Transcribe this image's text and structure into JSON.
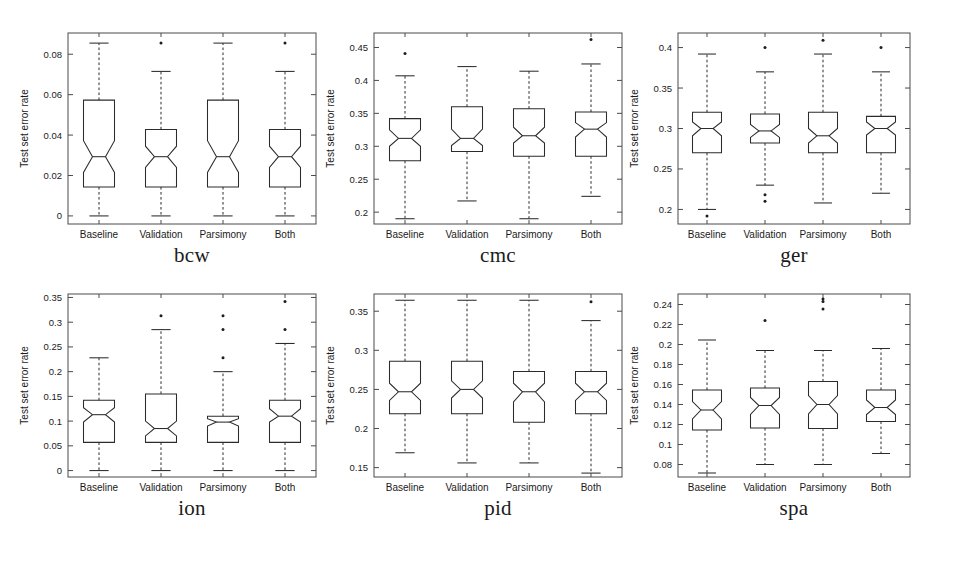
{
  "figure": {
    "title": "",
    "background": "#ffffff",
    "ink_color": "#2b2b2b",
    "rows": 2,
    "cols": 3
  },
  "common": {
    "ylabel": "Test set error rate",
    "groups": [
      "Baseline",
      "Validation",
      "Parsimony",
      "Both"
    ]
  },
  "chart_data": [
    {
      "type": "box",
      "panel_id": "bcw",
      "title": "bcw",
      "xlabel": "",
      "ylabel": "Test set error rate",
      "categories": [
        "Baseline",
        "Validation",
        "Parsimony",
        "Both"
      ],
      "yticks": [
        0,
        0.02,
        0.04,
        0.06,
        0.08
      ],
      "ytick_labels": [
        "0",
        "0.02",
        "0.04",
        "0.06",
        "0.08"
      ],
      "ylim": [
        -0.004,
        0.0905
      ],
      "grid": false,
      "legend": "none",
      "boxes": [
        {
          "label": "Baseline",
          "whisker_low": 0.0,
          "q1": 0.0143,
          "median": 0.0293,
          "q3": 0.0573,
          "whisker_high": 0.0855,
          "notch_low": 0.0215,
          "notch_high": 0.0372,
          "outliers": []
        },
        {
          "label": "Validation",
          "whisker_low": 0.0,
          "q1": 0.0143,
          "median": 0.0293,
          "q3": 0.0428,
          "whisker_high": 0.0715,
          "notch_low": 0.024,
          "notch_high": 0.0345,
          "outliers": [
            0.0855
          ]
        },
        {
          "label": "Parsimony",
          "whisker_low": 0.0,
          "q1": 0.0143,
          "median": 0.0293,
          "q3": 0.0573,
          "whisker_high": 0.0855,
          "notch_low": 0.0215,
          "notch_high": 0.0372,
          "outliers": []
        },
        {
          "label": "Both",
          "whisker_low": 0.0,
          "q1": 0.0143,
          "median": 0.0293,
          "q3": 0.0428,
          "whisker_high": 0.0715,
          "notch_low": 0.024,
          "notch_high": 0.0345,
          "outliers": [
            0.0855
          ]
        }
      ]
    },
    {
      "type": "box",
      "panel_id": "cmc",
      "title": "cmc",
      "xlabel": "",
      "ylabel": "Test set error rate",
      "categories": [
        "Baseline",
        "Validation",
        "Parsimony",
        "Both"
      ],
      "yticks": [
        0.2,
        0.25,
        0.3,
        0.35,
        0.4,
        0.45
      ],
      "ytick_labels": [
        "0.2",
        "0.25",
        "0.3",
        "0.35",
        "0.4",
        "0.45"
      ],
      "ylim": [
        0.182,
        0.472
      ],
      "grid": false,
      "legend": "none",
      "boxes": [
        {
          "label": "Baseline",
          "whisker_low": 0.19,
          "q1": 0.278,
          "median": 0.312,
          "q3": 0.342,
          "whisker_high": 0.407,
          "notch_low": 0.3,
          "notch_high": 0.325,
          "outliers": [
            0.441
          ]
        },
        {
          "label": "Validation",
          "whisker_low": 0.217,
          "q1": 0.292,
          "median": 0.312,
          "q3": 0.36,
          "whisker_high": 0.421,
          "notch_low": 0.301,
          "notch_high": 0.326,
          "outliers": []
        },
        {
          "label": "Parsimony",
          "whisker_low": 0.19,
          "q1": 0.285,
          "median": 0.316,
          "q3": 0.357,
          "whisker_high": 0.414,
          "notch_low": 0.305,
          "notch_high": 0.329,
          "outliers": []
        },
        {
          "label": "Both",
          "whisker_low": 0.224,
          "q1": 0.285,
          "median": 0.326,
          "q3": 0.352,
          "whisker_high": 0.425,
          "notch_low": 0.314,
          "notch_high": 0.336,
          "outliers": [
            0.462
          ]
        }
      ]
    },
    {
      "type": "box",
      "panel_id": "ger",
      "title": "ger",
      "xlabel": "",
      "ylabel": "Test set error rate",
      "categories": [
        "Baseline",
        "Validation",
        "Parsimony",
        "Both"
      ],
      "yticks": [
        0.2,
        0.25,
        0.3,
        0.35,
        0.4
      ],
      "ytick_labels": [
        "0.2",
        "0.25",
        "0.3",
        "0.35",
        "0.4"
      ],
      "ylim": [
        0.182,
        0.418
      ],
      "grid": false,
      "legend": "none",
      "boxes": [
        {
          "label": "Baseline",
          "whisker_low": 0.2,
          "q1": 0.27,
          "median": 0.3,
          "q3": 0.32,
          "whisker_high": 0.392,
          "notch_low": 0.291,
          "notch_high": 0.308,
          "outliers": [
            0.192
          ]
        },
        {
          "label": "Validation",
          "whisker_low": 0.23,
          "q1": 0.282,
          "median": 0.297,
          "q3": 0.318,
          "whisker_high": 0.37,
          "notch_low": 0.289,
          "notch_high": 0.305,
          "outliers": [
            0.4,
            0.218,
            0.21
          ]
        },
        {
          "label": "Parsimony",
          "whisker_low": 0.208,
          "q1": 0.27,
          "median": 0.291,
          "q3": 0.32,
          "whisker_high": 0.392,
          "notch_low": 0.282,
          "notch_high": 0.3,
          "outliers": [
            0.409
          ]
        },
        {
          "label": "Both",
          "whisker_low": 0.22,
          "q1": 0.27,
          "median": 0.3,
          "q3": 0.315,
          "whisker_high": 0.37,
          "notch_low": 0.292,
          "notch_high": 0.308,
          "outliers": [
            0.4
          ]
        }
      ]
    },
    {
      "type": "box",
      "panel_id": "ion",
      "title": "ion",
      "xlabel": "",
      "ylabel": "Test set error rate",
      "categories": [
        "Baseline",
        "Validation",
        "Parsimony",
        "Both"
      ],
      "yticks": [
        0,
        0.05,
        0.1,
        0.15,
        0.2,
        0.25,
        0.3,
        0.35
      ],
      "ytick_labels": [
        "0",
        "0.05",
        "0.1",
        "0.15",
        "0.2",
        "0.25",
        "0.3",
        "0.35"
      ],
      "ylim": [
        -0.013,
        0.357
      ],
      "grid": false,
      "legend": "none",
      "boxes": [
        {
          "label": "Baseline",
          "whisker_low": 0.0,
          "q1": 0.057,
          "median": 0.113,
          "q3": 0.142,
          "whisker_high": 0.228,
          "notch_low": 0.098,
          "notch_high": 0.127,
          "outliers": []
        },
        {
          "label": "Validation",
          "whisker_low": 0.0,
          "q1": 0.057,
          "median": 0.085,
          "q3": 0.155,
          "whisker_high": 0.285,
          "notch_low": 0.07,
          "notch_high": 0.1,
          "outliers": [
            0.313
          ]
        },
        {
          "label": "Parsimony",
          "whisker_low": 0.0,
          "q1": 0.057,
          "median": 0.098,
          "q3": 0.11,
          "whisker_high": 0.2,
          "notch_low": 0.09,
          "notch_high": 0.105,
          "outliers": [
            0.313,
            0.285,
            0.228
          ]
        },
        {
          "label": "Both",
          "whisker_low": 0.0,
          "q1": 0.057,
          "median": 0.11,
          "q3": 0.142,
          "whisker_high": 0.257,
          "notch_low": 0.098,
          "notch_high": 0.125,
          "outliers": [
            0.342,
            0.285
          ]
        }
      ]
    },
    {
      "type": "box",
      "panel_id": "pid",
      "title": "pid",
      "xlabel": "",
      "ylabel": "Test set error rate",
      "categories": [
        "Baseline",
        "Validation",
        "Parsimony",
        "Both"
      ],
      "yticks": [
        0.15,
        0.2,
        0.25,
        0.3,
        0.35
      ],
      "ytick_labels": [
        "0.15",
        "0.2",
        "0.25",
        "0.3",
        "0.35"
      ],
      "ylim": [
        0.138,
        0.372
      ],
      "grid": false,
      "legend": "none",
      "boxes": [
        {
          "label": "Baseline",
          "whisker_low": 0.169,
          "q1": 0.219,
          "median": 0.247,
          "q3": 0.286,
          "whisker_high": 0.364,
          "notch_low": 0.236,
          "notch_high": 0.258,
          "outliers": []
        },
        {
          "label": "Validation",
          "whisker_low": 0.156,
          "q1": 0.219,
          "median": 0.25,
          "q3": 0.286,
          "whisker_high": 0.364,
          "notch_low": 0.239,
          "notch_high": 0.261,
          "outliers": []
        },
        {
          "label": "Parsimony",
          "whisker_low": 0.156,
          "q1": 0.208,
          "median": 0.247,
          "q3": 0.273,
          "whisker_high": 0.364,
          "notch_low": 0.234,
          "notch_high": 0.258,
          "outliers": []
        },
        {
          "label": "Both",
          "whisker_low": 0.143,
          "q1": 0.219,
          "median": 0.247,
          "q3": 0.273,
          "whisker_high": 0.338,
          "notch_low": 0.236,
          "notch_high": 0.258,
          "outliers": [
            0.362
          ]
        }
      ]
    },
    {
      "type": "box",
      "panel_id": "spa",
      "title": "spa",
      "xlabel": "",
      "ylabel": "Test set error rate",
      "categories": [
        "Baseline",
        "Validation",
        "Parsimony",
        "Both"
      ],
      "yticks": [
        0.08,
        0.1,
        0.12,
        0.14,
        0.16,
        0.18,
        0.2,
        0.22,
        0.24
      ],
      "ytick_labels": [
        "0.08",
        "0.1",
        "0.12",
        "0.14",
        "0.16",
        "0.18",
        "0.2",
        "0.22",
        "0.24"
      ],
      "ylim": [
        0.0675,
        0.2505
      ],
      "grid": false,
      "legend": "none",
      "boxes": [
        {
          "label": "Baseline",
          "whisker_low": 0.0715,
          "q1": 0.1145,
          "median": 0.1345,
          "q3": 0.1545,
          "whisker_high": 0.2045,
          "notch_low": 0.1255,
          "notch_high": 0.143,
          "outliers": []
        },
        {
          "label": "Validation",
          "whisker_low": 0.08,
          "q1": 0.1165,
          "median": 0.139,
          "q3": 0.1565,
          "whisker_high": 0.194,
          "notch_low": 0.13,
          "notch_high": 0.147,
          "outliers": [
            0.224
          ]
        },
        {
          "label": "Parsimony",
          "whisker_low": 0.08,
          "q1": 0.116,
          "median": 0.14,
          "q3": 0.163,
          "whisker_high": 0.194,
          "notch_low": 0.1305,
          "notch_high": 0.149,
          "outliers": [
            0.2455,
            0.243,
            0.2355
          ]
        },
        {
          "label": "Both",
          "whisker_low": 0.091,
          "q1": 0.123,
          "median": 0.137,
          "q3": 0.1545,
          "whisker_high": 0.196,
          "notch_low": 0.13,
          "notch_high": 0.1445,
          "outliers": []
        }
      ]
    }
  ]
}
